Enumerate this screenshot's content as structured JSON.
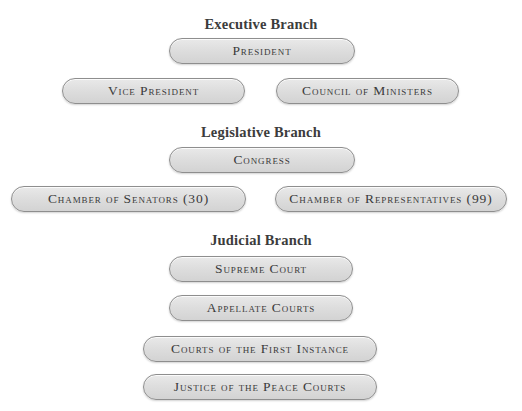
{
  "branches": {
    "executive": {
      "heading": "Executive Branch",
      "nodes": {
        "president": "President",
        "vice_president": "Vice President",
        "council": "Council of Ministers"
      }
    },
    "legislative": {
      "heading": "Legislative Branch",
      "nodes": {
        "congress": "Congress",
        "senators": "Chamber of Senators (30)",
        "representatives": "Chamber of Representatives (99)"
      }
    },
    "judicial": {
      "heading": "Judicial Branch",
      "nodes": {
        "supreme_court": "Supreme Court",
        "appellate_courts": "Appellate Courts",
        "first_instance": "Courts of the First Instance",
        "peace_courts": "Justice of the Peace Courts"
      }
    }
  },
  "colors": {
    "pill_fill": "#dedede",
    "pill_border": "#8e8e8e",
    "text": "#3a3a3a"
  }
}
